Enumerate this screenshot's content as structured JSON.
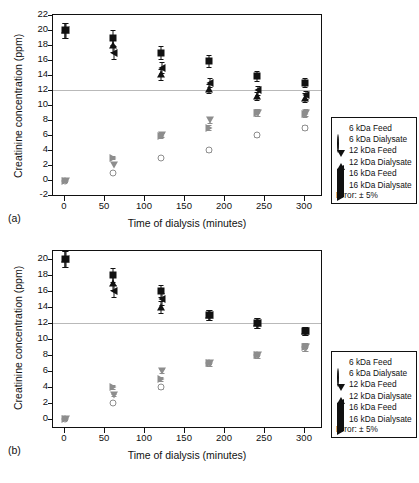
{
  "figure": {
    "axis_title_y": "Creatinine concentration (ppm)",
    "axis_title_x": "Time of dialysis (minutes)",
    "panel_a_label": "(a)",
    "panel_b_label": "(b)"
  },
  "legend": {
    "error_note": "Error: ± 5%",
    "entries": [
      {
        "symbol": "filled-square",
        "label": "6 kDa Feed"
      },
      {
        "symbol": "open-circle",
        "label": "6 kDa Dialysate"
      },
      {
        "symbol": "filled-triangle-up",
        "label": "12 kDa Feed"
      },
      {
        "symbol": "open-triangle-down",
        "label": "12 kDa Dialysate"
      },
      {
        "symbol": "filled-triangle-left",
        "label": "16 kDa Feed"
      },
      {
        "symbol": "open-triangle-right",
        "label": "16 kDa Dialysate"
      }
    ]
  },
  "chart_data": [
    {
      "id": "panel-a",
      "type": "scatter",
      "title": "",
      "panel": "(a)",
      "xlabel": "Time of dialysis (minutes)",
      "ylabel": "Creatinine concentration (ppm)",
      "xlim": [
        -15,
        320
      ],
      "ylim": [
        -2,
        22
      ],
      "xticks": [
        0,
        50,
        100,
        150,
        200,
        250,
        300
      ],
      "yticks": [
        -2,
        0,
        2,
        4,
        6,
        8,
        10,
        12,
        14,
        16,
        18,
        20,
        22
      ],
      "grid": false,
      "reference_line_y": 12,
      "error_percent": 5,
      "legend_position": "right-outside",
      "x": [
        0,
        60,
        120,
        180,
        240,
        300
      ],
      "series": [
        {
          "name": "6 kDa Feed",
          "symbol": "filled-square",
          "values": [
            20.0,
            19.0,
            17.0,
            15.9,
            13.9,
            13.0
          ]
        },
        {
          "name": "12 kDa Feed",
          "symbol": "filled-triangle-up",
          "values": [
            20.0,
            18.0,
            14.1,
            12.2,
            11.2,
            11.0
          ]
        },
        {
          "name": "16 kDa Feed",
          "symbol": "filled-triangle-left",
          "values": [
            20.0,
            17.0,
            15.0,
            13.0,
            12.0,
            11.3
          ]
        },
        {
          "name": "6 kDa Dialysate",
          "symbol": "open-circle",
          "values": [
            -0.1,
            1.0,
            3.0,
            4.0,
            6.0,
            7.0
          ]
        },
        {
          "name": "12 kDa Dialysate",
          "symbol": "open-triangle-down",
          "values": [
            -0.1,
            2.0,
            6.0,
            8.0,
            9.0,
            9.0
          ]
        },
        {
          "name": "16 kDa Dialysate",
          "symbol": "open-triangle-right",
          "values": [
            -0.1,
            3.0,
            5.9,
            7.0,
            9.0,
            8.8
          ]
        }
      ]
    },
    {
      "id": "panel-b",
      "type": "scatter",
      "title": "",
      "panel": "(b)",
      "xlabel": "Time of dialysis (minutes)",
      "ylabel": "Creatinine concentration (ppm)",
      "xlim": [
        -15,
        320
      ],
      "ylim": [
        -1,
        21
      ],
      "xticks": [
        0,
        50,
        100,
        150,
        200,
        250,
        300
      ],
      "yticks": [
        0,
        2,
        4,
        6,
        8,
        10,
        12,
        14,
        16,
        18,
        20
      ],
      "grid": false,
      "reference_line_y": 12,
      "error_percent": 5,
      "legend_position": "right-outside",
      "x": [
        0,
        60,
        120,
        180,
        240,
        300
      ],
      "series": [
        {
          "name": "6 kDa Feed",
          "symbol": "filled-square",
          "values": [
            20.0,
            18.0,
            16.0,
            13.0,
            12.0,
            11.0
          ]
        },
        {
          "name": "12 kDa Feed",
          "symbol": "filled-triangle-up",
          "values": [
            20.0,
            17.0,
            14.0,
            13.0,
            12.0,
            11.0
          ]
        },
        {
          "name": "16 kDa Feed",
          "symbol": "filled-triangle-left",
          "values": [
            20.0,
            16.0,
            15.0,
            13.0,
            12.0,
            11.0
          ]
        },
        {
          "name": "6 kDa Dialysate",
          "symbol": "open-circle",
          "values": [
            0.0,
            2.0,
            4.0,
            7.0,
            8.0,
            9.0
          ]
        },
        {
          "name": "12 kDa Dialysate",
          "symbol": "open-triangle-down",
          "values": [
            0.0,
            3.0,
            6.0,
            7.0,
            8.0,
            9.0
          ]
        },
        {
          "name": "16 kDa Dialysate",
          "symbol": "open-triangle-right",
          "values": [
            0.0,
            4.0,
            5.0,
            7.0,
            8.0,
            9.0
          ]
        }
      ]
    }
  ]
}
